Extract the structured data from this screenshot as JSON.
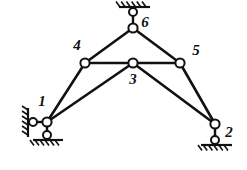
{
  "figure": {
    "type": "structural-diagram",
    "width": 247,
    "height": 170,
    "background_color": "#ffffff",
    "line_color": "#111111"
  },
  "nodes": [
    {
      "id": "1",
      "label": "1",
      "x": 47,
      "y": 122,
      "label_x": 42,
      "label_y": 103,
      "radius": 4.6
    },
    {
      "id": "2",
      "label": "2",
      "x": 215,
      "y": 124,
      "label_x": 229,
      "label_y": 134,
      "radius": 4.6
    },
    {
      "id": "3",
      "label": "3",
      "x": 133,
      "y": 63,
      "label_x": 133,
      "label_y": 81,
      "radius": 4.6
    },
    {
      "id": "4",
      "label": "4",
      "x": 85,
      "y": 63,
      "label_x": 77,
      "label_y": 47,
      "radius": 4.6
    },
    {
      "id": "5",
      "label": "5",
      "x": 180,
      "y": 63,
      "label_x": 196,
      "label_y": 52,
      "radius": 4.6
    },
    {
      "id": "6",
      "label": "6",
      "x": 133,
      "y": 28,
      "label_x": 145,
      "label_y": 24,
      "radius": 4.6
    }
  ],
  "members": [
    {
      "name": "member-1-4",
      "from": "1",
      "to": "4",
      "width": 2.6
    },
    {
      "name": "member-1-3",
      "from": "1",
      "to": "3",
      "width": 2.6
    },
    {
      "name": "member-4-3",
      "from": "4",
      "to": "3",
      "width": 2.6
    },
    {
      "name": "member-3-5",
      "from": "3",
      "to": "5",
      "width": 2.6
    },
    {
      "name": "member-3-2",
      "from": "3",
      "to": "2",
      "width": 2.6
    },
    {
      "name": "member-5-2",
      "from": "5",
      "to": "2",
      "width": 2.6
    },
    {
      "name": "member-4-6",
      "from": "4",
      "to": "6",
      "width": 2.6
    },
    {
      "name": "member-6-5",
      "from": "6",
      "to": "5",
      "width": 2.6
    }
  ],
  "supports": [
    {
      "name": "support-top-node-6",
      "kind": "pin-on-ceiling",
      "joint": {
        "x": 133,
        "y": 12,
        "radius": 4.0
      },
      "link": {
        "x1": 133,
        "y1": 12,
        "x2": 133,
        "y2": 28,
        "width": 2.4
      },
      "ground": {
        "x1": 119,
        "y1": 7,
        "x2": 150,
        "y2": 7,
        "width": 2.2
      },
      "hatch": {
        "count": 6,
        "start_x": 120,
        "spacing": 5.2,
        "y_top": 1.5,
        "y_bottom": 7,
        "dx": -4.0,
        "width": 1.6
      }
    },
    {
      "name": "support-left-node-1",
      "kind": "pin-on-wall",
      "joint": {
        "x": 33,
        "y": 122,
        "radius": 4.0
      },
      "link": {
        "x1": 33,
        "y1": 122,
        "x2": 47,
        "y2": 122,
        "width": 2.4
      },
      "ground": {
        "x1": 28,
        "y1": 108,
        "x2": 28,
        "y2": 137,
        "width": 2.2
      },
      "hatch": {
        "count": 6,
        "start_y": 110,
        "spacing": 5.0,
        "x_right": 28,
        "x_left": 22,
        "dy": -4.0,
        "width": 1.6
      }
    },
    {
      "name": "support-bottom-node-1",
      "kind": "pin-on-floor",
      "joint": {
        "x": 47,
        "y": 135,
        "radius": 4.0
      },
      "link": {
        "x1": 47,
        "y1": 122,
        "x2": 47,
        "y2": 135,
        "width": 2.4
      },
      "ground": {
        "x1": 33,
        "y1": 140,
        "x2": 63,
        "y2": 140,
        "width": 2.2
      },
      "hatch": {
        "count": 6,
        "start_x": 34,
        "spacing": 5.0,
        "y_top": 140,
        "y_bottom": 145.5,
        "dx": -4.0,
        "width": 1.6
      }
    },
    {
      "name": "support-bottom-node-2",
      "kind": "pin-on-floor",
      "joint": {
        "x": 215,
        "y": 140,
        "radius": 4.0
      },
      "link": {
        "x1": 215,
        "y1": 124,
        "x2": 215,
        "y2": 140,
        "width": 2.4
      },
      "ground": {
        "x1": 201,
        "y1": 145,
        "x2": 232,
        "y2": 145,
        "width": 2.2
      },
      "hatch": {
        "count": 6,
        "start_x": 202,
        "spacing": 5.2,
        "y_top": 145,
        "y_bottom": 150.5,
        "dx": -4.0,
        "width": 1.6
      }
    }
  ]
}
